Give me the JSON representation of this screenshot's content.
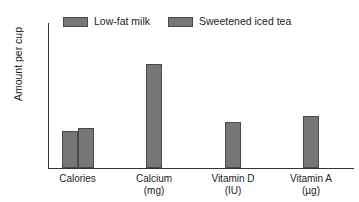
{
  "chart_data": {
    "type": "bar",
    "title": "",
    "xlabel": "",
    "ylabel": "Amount per cup",
    "ylim": [
      0,
      400
    ],
    "yticks": [
      0,
      50,
      100,
      150,
      200,
      250,
      300,
      350,
      400
    ],
    "ytick_labels": [
      "0",
      "50",
      "100",
      "150",
      "200",
      "250",
      "300",
      "350",
      "400"
    ],
    "grid": false,
    "legend_position": "top-left",
    "categories": [
      "Calories",
      "Calcium",
      "Vitamin D",
      "Vitamin A"
    ],
    "category_units": [
      "",
      "(mg)",
      "(IU)",
      "(µg)"
    ],
    "category_labels": [
      "Calories",
      "Calcium (mg)",
      "Vitamin D (IU)",
      "Vitamin A (µg)"
    ],
    "series": [
      {
        "name": "Low-fat milk",
        "color": "#767676",
        "values": [
          103,
          290,
          127,
          145
        ]
      },
      {
        "name": "Sweetened iced tea",
        "color": "#767676",
        "values": [
          110,
          0,
          0,
          0
        ]
      }
    ]
  },
  "legend": {
    "entries": [
      {
        "label": "Low-fat milk",
        "swatch_color": "#767676"
      },
      {
        "label": "Sweetened iced tea",
        "swatch_color": "#767676"
      }
    ]
  },
  "axes": {
    "y_title": "Amount per cup"
  },
  "colors": {
    "bar_fill": "#767676",
    "bar_border": "#4a4a4a",
    "axis": "#333333",
    "text": "#1d1d1d",
    "background": "#ffffff"
  }
}
